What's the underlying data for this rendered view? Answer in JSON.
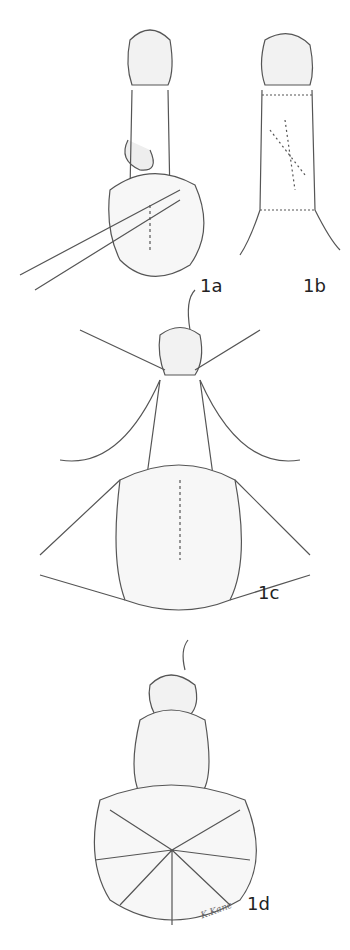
{
  "figure": {
    "panels": [
      {
        "id": "1a",
        "label": "1a"
      },
      {
        "id": "1b",
        "label": "1b"
      },
      {
        "id": "1c",
        "label": "1c"
      },
      {
        "id": "1d",
        "label": "1d"
      }
    ],
    "signature": "K.Kane",
    "colors": {
      "ink": "#555555",
      "shade": "#bbbbbb",
      "background": "#ffffff"
    }
  }
}
